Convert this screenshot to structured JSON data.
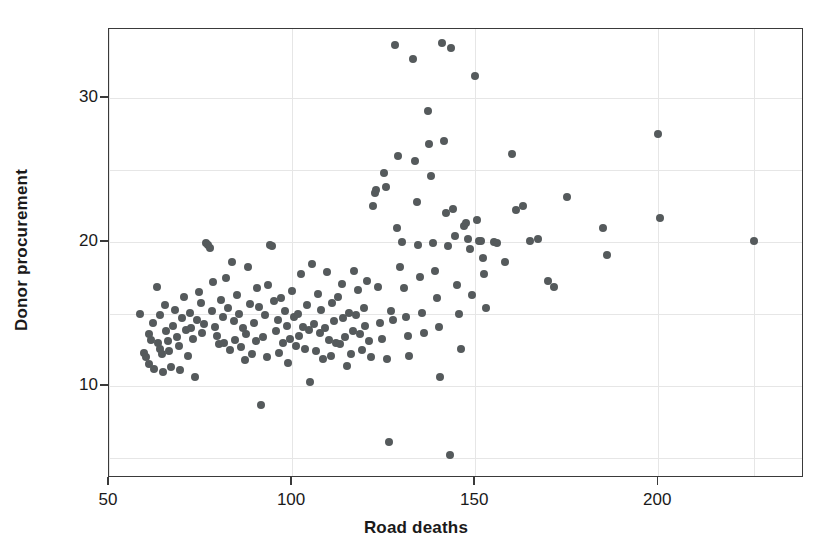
{
  "chart_data": {
    "type": "scatter",
    "title": "",
    "xlabel": "Road deaths",
    "ylabel": "Donor procurement",
    "xlim": [
      50,
      228
    ],
    "ylim": [
      4.2,
      35.5
    ],
    "xticks": [
      50,
      100,
      150,
      200
    ],
    "yticks": [
      10,
      20,
      30
    ],
    "xtick_labels": [
      "50",
      "100",
      "150",
      "200"
    ],
    "ytick_labels": [
      "10",
      "20",
      "30"
    ],
    "grid": true,
    "grid_x": [
      50,
      100,
      150,
      200,
      226
    ],
    "grid_y": [
      5,
      10,
      15,
      20,
      25,
      30,
      35
    ],
    "legend": null,
    "marker_color": "#555a5c",
    "marker_size": 8,
    "frame_color": "#3a3a3a",
    "gridline_color": "#e6e6e6",
    "n_points": 197,
    "points": [
      [
        58.5,
        15.0
      ],
      [
        59.5,
        12.3
      ],
      [
        60.2,
        12.0
      ],
      [
        60.8,
        13.6
      ],
      [
        61.0,
        11.5
      ],
      [
        61.5,
        13.2
      ],
      [
        62.0,
        14.4
      ],
      [
        62.3,
        11.2
      ],
      [
        63.0,
        16.9
      ],
      [
        63.4,
        13.0
      ],
      [
        63.8,
        12.6
      ],
      [
        64.0,
        14.9
      ],
      [
        64.5,
        12.2
      ],
      [
        64.8,
        11.0
      ],
      [
        65.2,
        15.6
      ],
      [
        65.5,
        13.8
      ],
      [
        66.0,
        13.1
      ],
      [
        66.5,
        12.4
      ],
      [
        67.0,
        11.3
      ],
      [
        67.4,
        14.2
      ],
      [
        68.0,
        15.3
      ],
      [
        68.5,
        13.4
      ],
      [
        69.0,
        12.8
      ],
      [
        69.5,
        11.1
      ],
      [
        70.0,
        14.7
      ],
      [
        70.5,
        16.2
      ],
      [
        71.0,
        13.9
      ],
      [
        71.5,
        12.1
      ],
      [
        72.0,
        15.1
      ],
      [
        72.5,
        14.0
      ],
      [
        73.0,
        13.3
      ],
      [
        73.5,
        10.6
      ],
      [
        74.0,
        14.6
      ],
      [
        74.5,
        16.5
      ],
      [
        75.0,
        15.8
      ],
      [
        75.5,
        13.7
      ],
      [
        76.0,
        14.3
      ],
      [
        76.4,
        19.9
      ],
      [
        77.0,
        19.8
      ],
      [
        77.5,
        19.6
      ],
      [
        78.0,
        15.2
      ],
      [
        78.5,
        17.2
      ],
      [
        79.0,
        14.1
      ],
      [
        79.5,
        13.5
      ],
      [
        80.0,
        12.9
      ],
      [
        80.5,
        16.0
      ],
      [
        81.0,
        14.8
      ],
      [
        81.5,
        13.0
      ],
      [
        82.0,
        17.5
      ],
      [
        82.5,
        15.4
      ],
      [
        83.0,
        12.5
      ],
      [
        83.5,
        18.6
      ],
      [
        84.0,
        14.5
      ],
      [
        84.5,
        13.2
      ],
      [
        85.0,
        16.3
      ],
      [
        85.5,
        15.0
      ],
      [
        86.0,
        12.7
      ],
      [
        86.5,
        14.0
      ],
      [
        87.0,
        11.8
      ],
      [
        87.5,
        13.6
      ],
      [
        88.0,
        18.3
      ],
      [
        88.5,
        15.7
      ],
      [
        89.0,
        12.2
      ],
      [
        89.5,
        14.4
      ],
      [
        90.0,
        13.1
      ],
      [
        90.5,
        16.8
      ],
      [
        91.0,
        15.5
      ],
      [
        91.5,
        8.7
      ],
      [
        92.0,
        13.4
      ],
      [
        92.5,
        14.9
      ],
      [
        93.0,
        12.0
      ],
      [
        93.5,
        17.0
      ],
      [
        94.0,
        19.8
      ],
      [
        94.6,
        19.7
      ],
      [
        95.0,
        15.9
      ],
      [
        95.5,
        13.8
      ],
      [
        96.0,
        14.6
      ],
      [
        96.5,
        12.3
      ],
      [
        97.0,
        16.1
      ],
      [
        97.5,
        13.0
      ],
      [
        98.0,
        15.2
      ],
      [
        98.5,
        14.2
      ],
      [
        99.0,
        11.6
      ],
      [
        99.5,
        13.3
      ],
      [
        100.0,
        16.6
      ],
      [
        100.5,
        14.8
      ],
      [
        101.0,
        12.8
      ],
      [
        101.5,
        15.0
      ],
      [
        102.0,
        13.5
      ],
      [
        102.5,
        17.8
      ],
      [
        103.0,
        14.1
      ],
      [
        103.5,
        12.6
      ],
      [
        104.0,
        15.6
      ],
      [
        104.5,
        13.9
      ],
      [
        105.0,
        10.3
      ],
      [
        105.5,
        18.5
      ],
      [
        106.0,
        14.3
      ],
      [
        106.5,
        12.4
      ],
      [
        107.0,
        16.4
      ],
      [
        107.5,
        13.7
      ],
      [
        108.0,
        15.3
      ],
      [
        108.5,
        11.9
      ],
      [
        109.0,
        14.0
      ],
      [
        109.5,
        17.9
      ],
      [
        110.0,
        13.2
      ],
      [
        110.5,
        12.1
      ],
      [
        111.0,
        15.8
      ],
      [
        111.5,
        14.5
      ],
      [
        112.0,
        13.0
      ],
      [
        112.5,
        16.2
      ],
      [
        113.0,
        12.9
      ],
      [
        113.5,
        17.1
      ],
      [
        114.0,
        14.7
      ],
      [
        114.5,
        13.4
      ],
      [
        115.0,
        11.4
      ],
      [
        115.5,
        15.1
      ],
      [
        116.0,
        12.2
      ],
      [
        116.5,
        13.8
      ],
      [
        117.0,
        18.0
      ],
      [
        117.5,
        14.9
      ],
      [
        118.0,
        16.7
      ],
      [
        118.5,
        13.6
      ],
      [
        119.0,
        12.5
      ],
      [
        119.5,
        15.4
      ],
      [
        120.0,
        14.2
      ],
      [
        120.5,
        17.3
      ],
      [
        121.0,
        13.1
      ],
      [
        121.5,
        12.0
      ],
      [
        122.0,
        22.5
      ],
      [
        122.5,
        23.4
      ],
      [
        123.0,
        23.6
      ],
      [
        123.5,
        16.9
      ],
      [
        124.0,
        14.4
      ],
      [
        124.5,
        13.3
      ],
      [
        125.0,
        24.8
      ],
      [
        125.5,
        23.8
      ],
      [
        126.0,
        11.9
      ],
      [
        126.5,
        6.1
      ],
      [
        127.0,
        15.2
      ],
      [
        127.5,
        14.6
      ],
      [
        128.0,
        33.7
      ],
      [
        128.5,
        21.0
      ],
      [
        129.0,
        26.0
      ],
      [
        129.5,
        18.3
      ],
      [
        130.0,
        20.0
      ],
      [
        130.5,
        16.8
      ],
      [
        131.0,
        14.8
      ],
      [
        131.5,
        13.5
      ],
      [
        132.0,
        12.1
      ],
      [
        133.0,
        32.7
      ],
      [
        133.5,
        25.6
      ],
      [
        134.0,
        22.8
      ],
      [
        134.5,
        19.8
      ],
      [
        135.0,
        17.6
      ],
      [
        135.5,
        15.1
      ],
      [
        136.0,
        13.7
      ],
      [
        137.0,
        29.1
      ],
      [
        137.5,
        26.8
      ],
      [
        138.0,
        24.6
      ],
      [
        138.5,
        19.9
      ],
      [
        139.0,
        18.0
      ],
      [
        139.5,
        16.1
      ],
      [
        140.0,
        14.1
      ],
      [
        140.5,
        10.6
      ],
      [
        141.0,
        33.8
      ],
      [
        141.5,
        27.0
      ],
      [
        142.0,
        22.0
      ],
      [
        142.5,
        19.7
      ],
      [
        143.0,
        5.2
      ],
      [
        143.5,
        33.5
      ],
      [
        144.0,
        22.3
      ],
      [
        144.5,
        20.4
      ],
      [
        145.0,
        17.0
      ],
      [
        145.5,
        15.0
      ],
      [
        146.0,
        12.6
      ],
      [
        147.0,
        21.1
      ],
      [
        147.5,
        21.3
      ],
      [
        148.0,
        20.2
      ],
      [
        148.5,
        19.5
      ],
      [
        149.0,
        16.3
      ],
      [
        150.0,
        31.5
      ],
      [
        150.5,
        21.5
      ],
      [
        151.0,
        20.1
      ],
      [
        151.5,
        20.1
      ],
      [
        152.0,
        18.9
      ],
      [
        152.5,
        17.8
      ],
      [
        153.0,
        15.4
      ],
      [
        155.0,
        20.0
      ],
      [
        156.0,
        19.9
      ],
      [
        158.0,
        18.6
      ],
      [
        160.0,
        26.1
      ],
      [
        161.0,
        22.2
      ],
      [
        163.0,
        22.5
      ],
      [
        165.0,
        20.1
      ],
      [
        167.0,
        20.2
      ],
      [
        170.0,
        17.3
      ],
      [
        171.5,
        16.9
      ],
      [
        175.0,
        23.1
      ],
      [
        185.0,
        21.0
      ],
      [
        186.0,
        19.1
      ],
      [
        200.0,
        27.5
      ],
      [
        200.5,
        21.7
      ],
      [
        226.0,
        20.1
      ]
    ]
  }
}
